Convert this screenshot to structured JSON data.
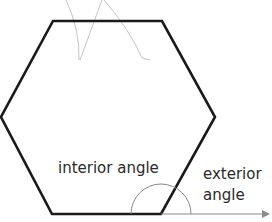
{
  "diagram": {
    "shape": "regular hexagon",
    "labels": {
      "interior": "interior angle",
      "exterior_line1": "exterior",
      "exterior_line2": "angle"
    },
    "colors": {
      "hexagon_stroke": "#1a1a1a",
      "arc_stroke": "#888888",
      "arrow_stroke": "#888888",
      "sketch_stroke": "#b0b0b0",
      "text": "#2a2a2a"
    }
  }
}
